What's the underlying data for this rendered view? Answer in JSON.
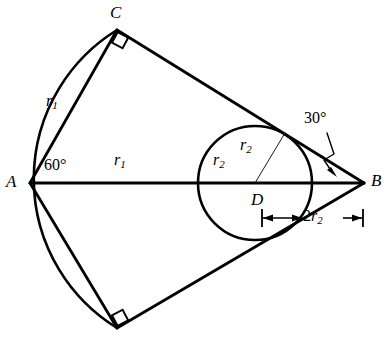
{
  "figure": {
    "background_color": "#ffffff",
    "stroke_color": "#000000",
    "thin_stroke_color": "#1a1a1a"
  },
  "points": [
    {
      "id": "A",
      "label": "A",
      "x": 30,
      "y": 183,
      "label_x": 11,
      "label_y": 183
    },
    {
      "id": "B",
      "label": "B",
      "x": 364,
      "y": 183,
      "label_x": 376,
      "label_y": 182
    },
    {
      "id": "C",
      "label": "C",
      "x": 117,
      "y": 30,
      "label_x": 117,
      "label_y": 12
    },
    {
      "id": "Cprime",
      "label": "",
      "x": 117,
      "y": 328,
      "label_x": 0,
      "label_y": 0
    },
    {
      "id": "D",
      "label": "D",
      "x": 255,
      "y": 183,
      "label_x": 256,
      "label_y": 201
    }
  ],
  "labels": {
    "vertex_a": "A",
    "vertex_b": "B",
    "vertex_c": "C",
    "center_d": "D",
    "angle_at_a": "60°",
    "angle_at_b": "30°",
    "radius_r1_side": {
      "base": "r",
      "sub": "1"
    },
    "radius_r1_axis": {
      "base": "r",
      "sub": "1"
    },
    "radius_r2_left": {
      "base": "r",
      "sub": "2"
    },
    "radius_r2_upper": {
      "base": "r",
      "sub": "2"
    },
    "diameter_2r2": {
      "prefix": "2",
      "base": "r",
      "sub": "2"
    }
  },
  "label_positions": {
    "r1_side": {
      "x": 52,
      "y": 103
    },
    "r1_axis": {
      "x": 120,
      "y": 164
    },
    "angle_60": {
      "x": 49,
      "y": 167
    },
    "angle_30": {
      "x": 306,
      "y": 118
    },
    "r2_left": {
      "x": 218,
      "y": 163
    },
    "r2_upper": {
      "x": 243,
      "y": 148
    },
    "dim_2r2": {
      "x": 318,
      "y": 209
    }
  },
  "circle": {
    "center_x": 255,
    "center_y": 183,
    "radius": 57,
    "stroke_width": 2.6
  },
  "arc": {
    "description": "circular arc centered at A with radius AC, from C to C' passing through (198,183)",
    "center_x": 30,
    "center_y": 183,
    "radius": 175,
    "start_x": 117,
    "start_y": 30,
    "end_x": 117,
    "end_y": 328,
    "stroke_width": 2.6
  },
  "segments": [
    {
      "name": "side-AC",
      "x1": 30,
      "y1": 183,
      "x2": 117,
      "y2": 30,
      "width": 2.8
    },
    {
      "name": "side-AC-prime",
      "x1": 30,
      "y1": 183,
      "x2": 117,
      "y2": 328,
      "width": 2.8
    },
    {
      "name": "side-CB",
      "x1": 117,
      "y1": 30,
      "x2": 364,
      "y2": 183,
      "width": 2.8
    },
    {
      "name": "side-C-prime-B",
      "x1": 117,
      "y1": 328,
      "x2": 364,
      "y2": 183,
      "width": 2.8
    },
    {
      "name": "axis-AB",
      "x1": 30,
      "y1": 183,
      "x2": 364,
      "y2": 183,
      "width": 3.0
    },
    {
      "name": "radius-D-to-tangent",
      "x1": 255,
      "y1": 183,
      "x2": 284,
      "y2": 134,
      "width": 1.0
    }
  ],
  "right_angles": [
    {
      "name": "right-angle-at-C",
      "x": 117,
      "y": 30,
      "size": 13,
      "rotation_deg": -60
    },
    {
      "name": "right-angle-at-C-prime",
      "x": 117,
      "y": 328,
      "size": 13,
      "rotation_deg": 60
    }
  ],
  "dimension_line": {
    "name": "diameter-dimension-2r2",
    "y": 218,
    "x_start": 262,
    "x_end": 363,
    "tick_half_height": 9,
    "label_gap_start": 300,
    "label_gap_end": 341
  },
  "leader_30": {
    "description": "leader from 30-degree text down to angle arrow near B",
    "path": "M 327 133 L 333 155 L 324 161 L 333 172",
    "arrow_x": 336,
    "arrow_y": 175
  }
}
